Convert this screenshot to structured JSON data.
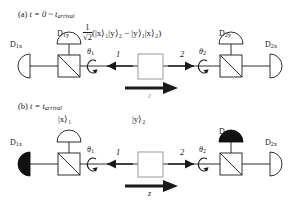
{
  "figure": {
    "type": "quantum-optics-schematic",
    "background": "#ffffff",
    "ink": "#1a1a1a",
    "panels": [
      {
        "id": "a",
        "caption_prefix": "(a)",
        "caption": "t = 0 ~ t",
        "caption_sub": "arrival",
        "state_label": "state-formula",
        "formula": {
          "coefficient_num": "1",
          "coefficient_den": "√2",
          "body": "(|x⟩₁|y⟩₂ − |y⟩₁|x⟩₂)"
        },
        "detectors": [
          {
            "name": "D",
            "sub": "1x",
            "orientation": "left",
            "filled": false
          },
          {
            "name": "D",
            "sub": "1y",
            "orientation": "up",
            "filled": false
          },
          {
            "name": "D",
            "sub": "2y",
            "orientation": "up",
            "filled": false
          },
          {
            "name": "D",
            "sub": "2x",
            "orientation": "right",
            "filled": false
          }
        ],
        "angles": [
          {
            "symbol": "θ",
            "sub": "1"
          },
          {
            "symbol": "θ",
            "sub": "2"
          }
        ],
        "beam_labels": [
          "1",
          "2"
        ],
        "axis_label": "z",
        "axis_visible": false
      },
      {
        "id": "b",
        "caption_prefix": "(b)",
        "caption": "t = t",
        "caption_sub": "arrival",
        "state_label": "collapsed-kets",
        "kets": [
          {
            "text": "|x⟩₁",
            "side": "left"
          },
          {
            "text": "|y⟩₂",
            "side": "center"
          }
        ],
        "detectors": [
          {
            "name": "D",
            "sub": "1x",
            "orientation": "left",
            "filled": true
          },
          {
            "name": "",
            "sub": "",
            "orientation": "up",
            "filled": false
          },
          {
            "name": "D",
            "sub": "2y",
            "orientation": "up",
            "filled": true
          },
          {
            "name": "D",
            "sub": "2x",
            "orientation": "right",
            "filled": false
          }
        ],
        "angles": [
          {
            "symbol": "θ",
            "sub": "1"
          },
          {
            "symbol": "θ",
            "sub": "2"
          }
        ],
        "beam_labels": [
          "1",
          "2"
        ],
        "axis_label": "z",
        "axis_visible": true
      }
    ],
    "components": {
      "source": "photon-pair-source-box",
      "beam_splitter": "polarizing-beam-splitter",
      "rotation_marker": "circular-arrow"
    }
  }
}
